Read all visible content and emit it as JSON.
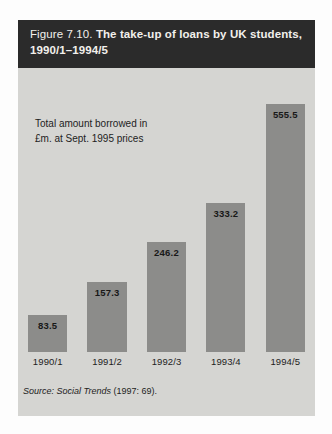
{
  "figure": {
    "number": "Figure 7.10.",
    "title": "The take-up of loans by UK students,",
    "title_line2": "1990/1–1994/5"
  },
  "annotation": {
    "line1": "Total amount borrowed in",
    "line2": "£m. at Sept. 1995 prices"
  },
  "source": {
    "prefix": "Source:",
    "publication": "Social Trends",
    "citation": "(1997: 69)."
  },
  "colors": {
    "title_band": "#2b2b2b",
    "title_text": "#f2f0ec",
    "panel_background": "#d5d5d2",
    "bar": "#8c8c8a",
    "text": "#1d1d1d"
  },
  "chart_data": {
    "type": "bar",
    "title": "The take-up of loans by UK students, 1990/1–1994/5",
    "subtitle": "Total amount borrowed in £m. at Sept. 1995 prices",
    "xlabel": "",
    "ylabel": "Total amount borrowed in £m. at Sept. 1995 prices",
    "categories": [
      "1990/1",
      "1991/2",
      "1992/3",
      "1993/4",
      "1994/5"
    ],
    "values": [
      83.5,
      157.3,
      246.2,
      333.2,
      555.5
    ],
    "value_labels": [
      "83.5",
      "157.3",
      "246.2",
      "333.2",
      "555.5"
    ],
    "ylim": [
      0,
      600
    ],
    "grid": false,
    "legend": null,
    "source": "Social Trends (1997: 69)."
  }
}
